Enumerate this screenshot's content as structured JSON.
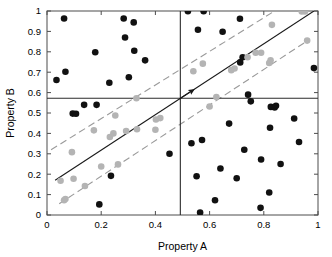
{
  "chart_data": {
    "type": "scatter",
    "title": "",
    "xlabel": "Property A",
    "ylabel": "Property B",
    "xlim": [
      0,
      1
    ],
    "ylim": [
      0,
      1
    ],
    "xticks": [
      0,
      0.2,
      0.4,
      0.6,
      0.8,
      1
    ],
    "xticklabels": [
      "0",
      "0.2",
      "0.4",
      "0.6",
      "0.8",
      "1"
    ],
    "yticks": [
      0,
      0.1,
      0.2,
      0.3,
      0.4,
      0.5,
      0.6,
      0.7,
      0.8,
      0.9,
      1
    ],
    "yticklabels": [
      "0",
      "0.1",
      "0.2",
      "0.3",
      "0.4",
      "0.5",
      "0.6",
      "0.7",
      "0.8",
      "0.9",
      "1"
    ],
    "grid": false,
    "legend": null,
    "colors": {
      "correlated_points": "#b4b4b4",
      "scattered_points": "#111111",
      "fit_line": "#1a1a1a",
      "band_lines": "#9a9a9a",
      "divider_lines": "#2b2b2b",
      "axis": "#4d4d4d"
    },
    "series": [
      {
        "name": "scattered-points",
        "marker": "filled-circle",
        "color": "#111111",
        "points": [
          [
            0.035,
            0.662
          ],
          [
            0.063,
            0.963
          ],
          [
            0.068,
            0.702
          ],
          [
            0.095,
            0.497
          ],
          [
            0.107,
            0.496
          ],
          [
            0.137,
            0.54
          ],
          [
            0.178,
            0.798
          ],
          [
            0.183,
            0.54
          ],
          [
            0.193,
            0.052
          ],
          [
            0.23,
            0.648
          ],
          [
            0.236,
            0.192
          ],
          [
            0.283,
            0.963
          ],
          [
            0.288,
            0.87
          ],
          [
            0.32,
            0.944
          ],
          [
            0.322,
            0.805
          ],
          [
            0.302,
            0.675
          ],
          [
            0.362,
            0.758
          ],
          [
            0.452,
            0.3
          ],
          [
            0.52,
            0.999
          ],
          [
            0.533,
            0.352
          ],
          [
            0.552,
            0.19
          ],
          [
            0.557,
            0.908
          ],
          [
            0.565,
            0.012
          ],
          [
            0.572,
            0.368
          ],
          [
            0.578,
            0.999
          ],
          [
            0.62,
            0.072
          ],
          [
            0.64,
            0.228
          ],
          [
            0.648,
            0.898
          ],
          [
            0.672,
            0.448
          ],
          [
            0.7,
            0.18
          ],
          [
            0.712,
            0.962
          ],
          [
            0.713,
            0.748
          ],
          [
            0.722,
            0.773
          ],
          [
            0.728,
            0.32
          ],
          [
            0.742,
            0.59
          ],
          [
            0.752,
            0.557
          ],
          [
            0.788,
            0.035
          ],
          [
            0.79,
            0.272
          ],
          [
            0.82,
            0.11
          ],
          [
            0.823,
            0.428
          ],
          [
            0.826,
            0.53
          ],
          [
            0.84,
            0.527
          ],
          [
            0.845,
            0.535
          ],
          [
            0.862,
            0.25
          ],
          [
            0.912,
            0.473
          ],
          [
            0.93,
            0.358
          ],
          [
            0.985,
            0.72
          ]
        ]
      },
      {
        "name": "correlated-points",
        "marker": "filled-circle",
        "color": "#b4b4b4",
        "points": [
          [
            0.05,
            0.168
          ],
          [
            0.063,
            0.072
          ],
          [
            0.068,
            0.078
          ],
          [
            0.092,
            0.308
          ],
          [
            0.098,
            0.178
          ],
          [
            0.14,
            0.142
          ],
          [
            0.173,
            0.415
          ],
          [
            0.2,
            0.238
          ],
          [
            0.232,
            0.382
          ],
          [
            0.245,
            0.4
          ],
          [
            0.252,
            0.488
          ],
          [
            0.262,
            0.248
          ],
          [
            0.292,
            0.412
          ],
          [
            0.33,
            0.572
          ],
          [
            0.332,
            0.42
          ],
          [
            0.4,
            0.418
          ],
          [
            0.402,
            0.468
          ],
          [
            0.418,
            0.475
          ],
          [
            0.54,
            0.705
          ],
          [
            0.575,
            0.742
          ],
          [
            0.6,
            0.532
          ],
          [
            0.625,
            0.578
          ],
          [
            0.68,
            0.71
          ],
          [
            0.692,
            0.718
          ],
          [
            0.74,
            0.773
          ],
          [
            0.77,
            0.795
          ],
          [
            0.79,
            0.795
          ],
          [
            0.82,
            0.745
          ],
          [
            0.825,
            0.758
          ],
          [
            0.83,
            0.932
          ],
          [
            0.94,
            0.998
          ],
          [
            0.952,
            0.998
          ],
          [
            0.96,
            0.855
          ]
        ]
      }
    ],
    "lines": [
      {
        "name": "regression-fit-line",
        "style": "solid",
        "arrow": true,
        "color": "#1a1a1a",
        "from": [
          0.03,
          0.17
        ],
        "to": [
          0.985,
          1.0
        ]
      },
      {
        "name": "upper-confidence-band",
        "style": "dashed",
        "color": "#9a9a9a",
        "from": [
          0.015,
          0.32
        ],
        "to": [
          0.84,
          1.0
        ]
      },
      {
        "name": "lower-confidence-band",
        "style": "dashed",
        "color": "#9a9a9a",
        "from": [
          0.045,
          0.055
        ],
        "to": [
          0.962,
          0.855
        ]
      },
      {
        "name": "vertical-divider",
        "style": "solid",
        "color": "#2b2b2b",
        "from": [
          0.492,
          0.0
        ],
        "to": [
          0.492,
          1.0
        ]
      },
      {
        "name": "horizontal-divider",
        "style": "solid",
        "color": "#2b2b2b",
        "from": [
          0.0,
          0.572
        ],
        "to": [
          1.0,
          0.572
        ]
      }
    ]
  }
}
